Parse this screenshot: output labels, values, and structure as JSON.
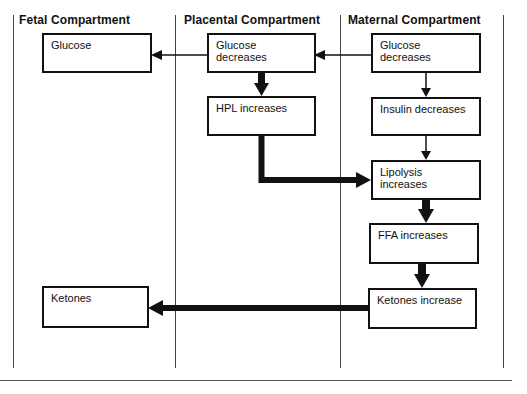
{
  "diagram": {
    "columns": [
      {
        "id": "fetal",
        "label": "Fetal Compartment"
      },
      {
        "id": "placental",
        "label": "Placental Compartment"
      },
      {
        "id": "maternal",
        "label": "Maternal Compartment"
      }
    ],
    "nodes": {
      "fetal_glucose": "Glucose",
      "fetal_ketones": "Ketones",
      "placental_glucose": "Glucose decreases",
      "placental_hpl": "HPL increases",
      "maternal_glucose": "Glucose decreases",
      "maternal_insulin": "Insulin decreases",
      "maternal_lipolysis": "Lipolysis increases",
      "maternal_ffa": "FFA increases",
      "maternal_ketones": "Ketones increase"
    },
    "edges": [
      {
        "from": "maternal_glucose",
        "to": "placental_glucose",
        "weight": "thin"
      },
      {
        "from": "placental_glucose",
        "to": "fetal_glucose",
        "weight": "thin"
      },
      {
        "from": "placental_glucose",
        "to": "placental_hpl",
        "weight": "thick"
      },
      {
        "from": "maternal_glucose",
        "to": "maternal_insulin",
        "weight": "thin"
      },
      {
        "from": "maternal_insulin",
        "to": "maternal_lipolysis",
        "weight": "thin"
      },
      {
        "from": "placental_hpl",
        "to": "maternal_lipolysis",
        "weight": "thick"
      },
      {
        "from": "maternal_lipolysis",
        "to": "maternal_ffa",
        "weight": "thick"
      },
      {
        "from": "maternal_ffa",
        "to": "maternal_ketones",
        "weight": "thick"
      },
      {
        "from": "maternal_ketones",
        "to": "fetal_ketones",
        "weight": "thick"
      }
    ]
  }
}
